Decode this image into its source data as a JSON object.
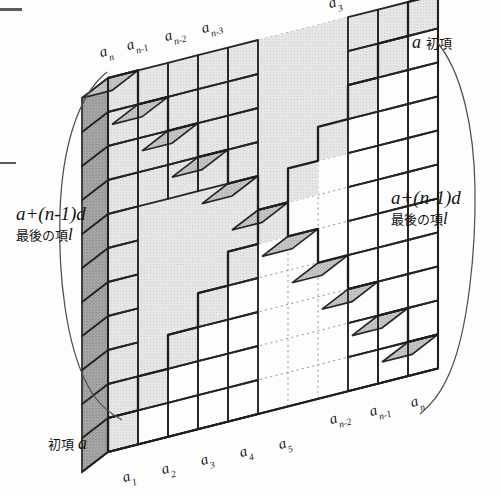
{
  "figure": {
    "colors": {
      "background": "#fdfdfd",
      "face_front_light": "#e2e2e2",
      "face_front_white": "#ffffff",
      "face_top": "#bdbdbd",
      "face_side_dark": "#9c9c9c",
      "outline": "#262626",
      "dotted_grid": "#8a8a8a",
      "brace": "#4a4a4a",
      "text": "#141414"
    }
  },
  "labels": {
    "top_terms": [
      {
        "base": "a",
        "sub": "n",
        "x": 103,
        "y": 45,
        "rot": -17
      },
      {
        "base": "a",
        "sub": "n-1",
        "x": 128,
        "y": 38,
        "rot": -17
      },
      {
        "base": "a",
        "sub": "n-2",
        "x": 163,
        "y": 30,
        "rot": -17
      },
      {
        "base": "a",
        "sub": "n-3",
        "x": 199,
        "y": 22,
        "rot": -17
      },
      {
        "base": "a",
        "sub": "3",
        "x": 331,
        "y": 11,
        "rot": -17
      }
    ],
    "bottom_terms_left": [
      {
        "base": "a",
        "sub": "1",
        "x": 127,
        "y": 483,
        "rot": -17
      },
      {
        "base": "a",
        "sub": "2",
        "x": 165,
        "y": 475,
        "rot": -17
      },
      {
        "base": "a",
        "sub": "3",
        "x": 203,
        "y": 467,
        "rot": -17
      },
      {
        "base": "a",
        "sub": "4",
        "x": 241,
        "y": 459,
        "rot": -17
      },
      {
        "base": "a",
        "sub": "5",
        "x": 279,
        "y": 451,
        "rot": -17
      }
    ],
    "bottom_terms_right": [
      {
        "base": "a",
        "sub": "n-2",
        "x": 334,
        "y": 424,
        "rot": -17
      },
      {
        "base": "a",
        "sub": "n-1",
        "x": 372,
        "y": 416,
        "rot": -17
      },
      {
        "base": "a",
        "sub": "n",
        "x": 412,
        "y": 408,
        "rot": -17
      }
    ],
    "first_term_top_right": {
      "symbol": "a",
      "jp": "初項",
      "x": 412,
      "y": 34
    },
    "first_term_bottom_left": {
      "jp": "初項",
      "symbol": "a",
      "x": 50,
      "y": 438
    },
    "last_term_left": {
      "formula_a": "a",
      "formula_plus": "+(",
      "formula_n": "n",
      "formula_minus1": "-1)",
      "formula_d": "d",
      "formula_full": "a+(n-1)d",
      "jp": "最後の項",
      "jp_symbol": "l",
      "x": 16,
      "y": 206
    },
    "last_term_right": {
      "formula_full": "a+(n-1)d",
      "jp": "最後の項",
      "jp_symbol": "l",
      "x": 390,
      "y": 190
    }
  },
  "geometry": {
    "columns": 11,
    "rows": 11,
    "visible_columns_left": 5,
    "visible_columns_right": 3,
    "skew_dx_per_col": 30.0,
    "skew_dy_per_col": -7.6,
    "row_height": 34.0,
    "depth_dx": 26,
    "depth_dy": -20,
    "origin_x": 108,
    "origin_y": 452,
    "ellipsis_col_start": 5,
    "ellipsis_col_end": 8,
    "ellipsis_row_start": 5,
    "ellipsis_row_end": 7
  },
  "artifacts": [
    {
      "x": 0,
      "y": 8,
      "w": 22,
      "h": 3
    },
    {
      "x": 0,
      "y": 162,
      "w": 16,
      "h": 2
    }
  ]
}
